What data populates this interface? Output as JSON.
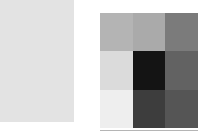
{
  "background_color": "#ffffff",
  "panel_left": {
    "name": "uniform gray panel",
    "fill_color": "#e3e3e3",
    "x": 0,
    "y": 0,
    "width": 74,
    "height": 122
  },
  "panel_right": {
    "name": "grayscale grid panel",
    "x": 100,
    "y": 13,
    "width": 98,
    "height": 115,
    "rows": 3,
    "cols": 3
  },
  "divider": {
    "name": "horizontal rule",
    "color": "#b5b5b5",
    "x": 100,
    "y": 130,
    "width": 98,
    "height": 1
  },
  "chart_data": {
    "type": "heatmap",
    "title": "",
    "subtitle": "",
    "xlabel": "",
    "ylabel": "",
    "categories_x": [
      "",
      "",
      ""
    ],
    "categories_y": [
      "",
      "",
      ""
    ],
    "grid": false,
    "legend": "none",
    "colormap": "grayscale",
    "value_range": [
      0.08,
      0.94
    ],
    "cells": [
      {
        "row": 0,
        "col": 0,
        "value": 0.7,
        "color": "#b4b4b4"
      },
      {
        "row": 0,
        "col": 1,
        "value": 0.66,
        "color": "#aaaaaa"
      },
      {
        "row": 0,
        "col": 2,
        "value": 0.48,
        "color": "#7b7b7b"
      },
      {
        "row": 1,
        "col": 0,
        "value": 0.86,
        "color": "#dbdbdb"
      },
      {
        "row": 1,
        "col": 1,
        "value": 0.08,
        "color": "#141414"
      },
      {
        "row": 1,
        "col": 2,
        "value": 0.38,
        "color": "#626262"
      },
      {
        "row": 2,
        "col": 0,
        "value": 0.94,
        "color": "#eeeeee"
      },
      {
        "row": 2,
        "col": 1,
        "value": 0.24,
        "color": "#3d3d3d"
      },
      {
        "row": 2,
        "col": 2,
        "value": 0.33,
        "color": "#555555"
      }
    ],
    "values": [
      [
        0.7,
        0.66,
        0.48
      ],
      [
        0.86,
        0.08,
        0.38
      ],
      [
        0.94,
        0.24,
        0.33
      ]
    ]
  }
}
